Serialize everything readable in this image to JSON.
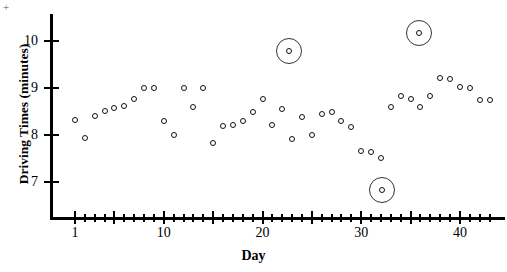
{
  "chart_data": {
    "type": "scatter",
    "title": "",
    "xlabel": "Day",
    "ylabel": "Driving Times (minutes)",
    "xlim": [
      0,
      43.5
    ],
    "ylim": [
      6.45,
      10.6
    ],
    "xticks_major": [
      1,
      5,
      10,
      15,
      20,
      25,
      30,
      35,
      40
    ],
    "xticks_minor": [
      2,
      3,
      4,
      6,
      7,
      8,
      9,
      11,
      12,
      13,
      14,
      16,
      17,
      18,
      19,
      21,
      22,
      23,
      24,
      26,
      27,
      28,
      29,
      31,
      32,
      33,
      34,
      36,
      37,
      38,
      39,
      41,
      42,
      43
    ],
    "xtick_labels": [
      {
        "value": 1,
        "label": "1"
      },
      {
        "value": 10,
        "label": "10"
      },
      {
        "value": 20,
        "label": "20"
      },
      {
        "value": 30,
        "label": "30"
      },
      {
        "value": 40,
        "label": "40"
      }
    ],
    "yticks": [
      7,
      8,
      9,
      10
    ],
    "ytick_labels": [
      "7",
      "8",
      "9",
      "10"
    ],
    "grid": false,
    "legend": null,
    "marker": "open-circle",
    "x": [
      1,
      2,
      3,
      4,
      5,
      6,
      7,
      8,
      9,
      10,
      11,
      12,
      13,
      14,
      15,
      16,
      17,
      18,
      19,
      20,
      21,
      22,
      23,
      24,
      25,
      26,
      27,
      28,
      29,
      30,
      31,
      32,
      33,
      34,
      35,
      36,
      37,
      38,
      39,
      40,
      41,
      42,
      43
    ],
    "y": [
      8.32,
      7.94,
      8.4,
      8.52,
      8.57,
      8.62,
      8.76,
      9.0,
      9.0,
      8.3,
      8.0,
      9.0,
      8.6,
      9.0,
      7.82,
      8.2,
      8.22,
      8.3,
      8.48,
      8.76,
      8.22,
      8.55,
      7.92,
      8.38,
      8.0,
      8.45,
      8.48,
      8.3,
      8.16,
      7.66,
      7.64,
      7.52,
      8.6,
      8.82,
      8.76,
      8.6,
      8.82,
      9.22,
      9.2,
      9.02,
      9.0,
      8.74,
      8.74
    ],
    "annotations": [
      {
        "type": "circled-outlier",
        "x": 22.7,
        "y": 9.79,
        "label": "outlier-high-1"
      },
      {
        "type": "circled-outlier",
        "x": 35.9,
        "y": 10.17,
        "label": "outlier-high-2"
      },
      {
        "type": "circled-outlier",
        "x": 32.1,
        "y": 6.83,
        "label": "outlier-low-1"
      }
    ]
  },
  "corner_mark": "+"
}
